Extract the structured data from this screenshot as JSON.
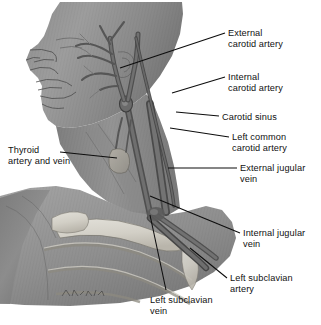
{
  "figure": {
    "signature": "artist-signature",
    "background_color": "#ffffff",
    "ink_color": "#111111",
    "skin_tone_light": "#b9b9b9",
    "skin_tone_mid": "#9a9a9a",
    "skin_tone_dark": "#6f6f6f",
    "bone_tone": "#d8d5ce",
    "vessel_tone": "#5d5d5d"
  },
  "labels": [
    {
      "id": "external-carotid-artery",
      "text": "External\ncarotid artery",
      "x": 228,
      "y": 28,
      "align": "left"
    },
    {
      "id": "internal-carotid-artery",
      "text": "Internal\ncarotid artery",
      "x": 228,
      "y": 72,
      "align": "left"
    },
    {
      "id": "carotid-sinus",
      "text": "Carotid sinus",
      "x": 222,
      "y": 112,
      "align": "left"
    },
    {
      "id": "left-common-carotid-artery",
      "text": "Left common\ncarotid artery",
      "x": 232,
      "y": 132,
      "align": "left"
    },
    {
      "id": "external-jugular-vein",
      "text": "External jugular\nvein",
      "x": 240,
      "y": 163,
      "align": "left"
    },
    {
      "id": "internal-jugular-vein",
      "text": "Internal jugular\nvein",
      "x": 243,
      "y": 228,
      "align": "left"
    },
    {
      "id": "left-subclavian-artery",
      "text": "Left subclavian\nartery",
      "x": 230,
      "y": 273,
      "align": "left"
    },
    {
      "id": "left-subclavian-vein",
      "text": "Left subclavian\nvein",
      "x": 150,
      "y": 295,
      "align": "left"
    },
    {
      "id": "thyroid-artery-and-vein",
      "text": "Thyroid\nartery and vein",
      "x": 8,
      "y": 145,
      "align": "left"
    }
  ],
  "leader_lines": [
    {
      "id": "leader-external-carotid-artery",
      "x1": 225,
      "y1": 33,
      "x2": 120,
      "y2": 68
    },
    {
      "id": "leader-internal-carotid-artery",
      "x1": 225,
      "y1": 77,
      "x2": 172,
      "y2": 93
    },
    {
      "id": "leader-carotid-sinus",
      "x1": 219,
      "y1": 116,
      "x2": 176,
      "y2": 112
    },
    {
      "id": "leader-left-common-carotid-artery",
      "x1": 229,
      "y1": 137,
      "x2": 170,
      "y2": 128
    },
    {
      "id": "leader-external-jugular-vein",
      "x1": 237,
      "y1": 168,
      "x2": 168,
      "y2": 168
    },
    {
      "id": "leader-internal-jugular-vein",
      "x1": 240,
      "y1": 233,
      "x2": 150,
      "y2": 196
    },
    {
      "id": "leader-left-subclavian-artery",
      "x1": 227,
      "y1": 278,
      "x2": 190,
      "y2": 248
    },
    {
      "id": "leader-left-subclavian-vein",
      "x1": 166,
      "y1": 290,
      "x2": 150,
      "y2": 215
    },
    {
      "id": "leader-thyroid-artery-and-vein",
      "x1": 60,
      "y1": 152,
      "x2": 117,
      "y2": 158
    }
  ]
}
